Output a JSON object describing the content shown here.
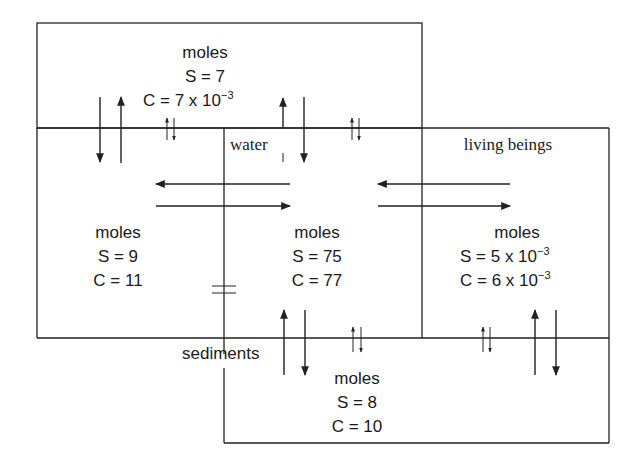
{
  "diagram": {
    "compartments": {
      "atmosphere": {
        "label": "",
        "unit": "moles",
        "S": "S = 7",
        "C_base": "C = 7 x 10",
        "C_exp": "−3"
      },
      "soil": {
        "label": "",
        "unit": "moles",
        "S": "S = 9",
        "C": "C = 11"
      },
      "water": {
        "label": "water",
        "unit": "moles",
        "S": "S = 75",
        "C": "C = 77"
      },
      "living_beings": {
        "label": "living beings",
        "unit": "moles",
        "S_base": "S = 5 x 10",
        "S_exp": "−3",
        "C_base": "C = 6 x 10",
        "C_exp": "−3"
      },
      "sediments": {
        "label": "sediments",
        "unit": "moles",
        "S": "S = 8",
        "C": "C = 10"
      }
    }
  }
}
